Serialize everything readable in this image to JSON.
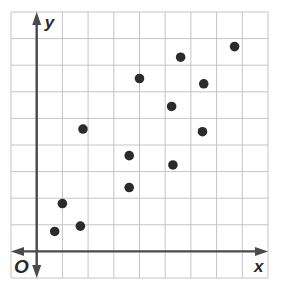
{
  "chart_data": {
    "type": "scatter",
    "title": "",
    "xlabel": "x",
    "ylabel": "y",
    "origin_label": "O",
    "xlim": [
      -1,
      9
    ],
    "ylim": [
      -1,
      9
    ],
    "grid": true,
    "grid_step": 1,
    "tick_labels": false,
    "legend": null,
    "points": [
      {
        "x": 0.7,
        "y": 0.75
      },
      {
        "x": 1.0,
        "y": 1.8
      },
      {
        "x": 1.7,
        "y": 0.95
      },
      {
        "x": 1.8,
        "y": 4.6
      },
      {
        "x": 3.6,
        "y": 3.6
      },
      {
        "x": 3.6,
        "y": 2.4
      },
      {
        "x": 4.0,
        "y": 6.5
      },
      {
        "x": 5.25,
        "y": 5.45
      },
      {
        "x": 5.3,
        "y": 3.25
      },
      {
        "x": 5.6,
        "y": 7.3
      },
      {
        "x": 6.5,
        "y": 6.3
      },
      {
        "x": 6.45,
        "y": 4.5
      },
      {
        "x": 7.7,
        "y": 7.7
      }
    ]
  },
  "colors": {
    "grid": "#c4c4c4",
    "axis": "#4a4a4a",
    "point": "#2b2b2b",
    "background": "#ffffff"
  }
}
